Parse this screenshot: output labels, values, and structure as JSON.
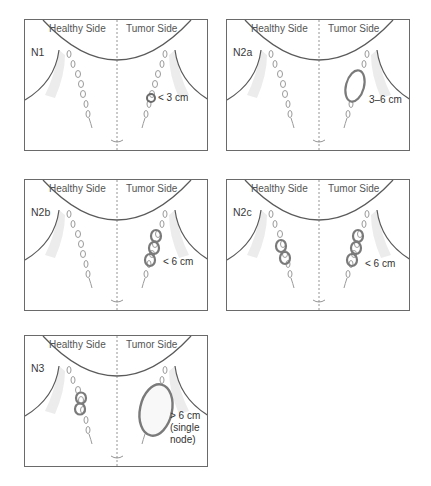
{
  "labels": {
    "healthy": "Healthy Side",
    "tumor": "Tumor Side"
  },
  "panels": [
    {
      "stage": "N1",
      "size": "< 3 cm"
    },
    {
      "stage": "N2a",
      "size": "3–6 cm"
    },
    {
      "stage": "N2b",
      "size": "< 6 cm"
    },
    {
      "stage": "N2c",
      "size": "< 6 cm"
    },
    {
      "stage": "N3",
      "size_lines": [
        "> 6 cm",
        "(single",
        "node)"
      ]
    }
  ],
  "colors": {
    "outline": "#6a6a6a",
    "node": "#9a9a9a",
    "node_enlarged": "#7a7a7a",
    "shadow": "#e6e6e6"
  }
}
